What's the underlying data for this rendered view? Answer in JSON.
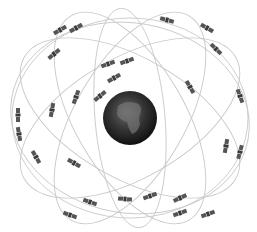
{
  "diagram": {
    "title": "",
    "earth": {
      "cx": 130,
      "cy": 118,
      "r": 27,
      "label": "earth",
      "color": "#2a2a2a"
    },
    "orbit_color": "#c8c8c8",
    "satellite_color": "#555555",
    "orbits": [
      {
        "cx": 130,
        "cy": 118,
        "rx": 118,
        "ry": 100,
        "rot": 0
      },
      {
        "cx": 130,
        "cy": 118,
        "rx": 122,
        "ry": 60,
        "rot": 30
      },
      {
        "cx": 130,
        "cy": 118,
        "rx": 122,
        "ry": 60,
        "rot": -30
      },
      {
        "cx": 130,
        "cy": 118,
        "rx": 118,
        "ry": 55,
        "rot": 60
      },
      {
        "cx": 130,
        "cy": 118,
        "rx": 118,
        "ry": 55,
        "rot": -60
      },
      {
        "cx": 130,
        "cy": 118,
        "rx": 110,
        "ry": 35,
        "rot": 85
      },
      {
        "cx": 130,
        "cy": 118,
        "rx": 120,
        "ry": 95,
        "rot": 10
      }
    ],
    "satellites": [
      {
        "x": 60,
        "y": 30,
        "rot": -30
      },
      {
        "x": 76,
        "y": 28,
        "rot": -30
      },
      {
        "x": 54,
        "y": 54,
        "rot": -40
      },
      {
        "x": 108,
        "y": 64,
        "rot": -20
      },
      {
        "x": 127,
        "y": 61,
        "rot": -20
      },
      {
        "x": 114,
        "y": 78,
        "rot": -30
      },
      {
        "x": 100,
        "y": 96,
        "rot": -40
      },
      {
        "x": 76,
        "y": 97,
        "rot": -70
      },
      {
        "x": 52,
        "y": 110,
        "rot": -80
      },
      {
        "x": 18,
        "y": 115,
        "rot": 90
      },
      {
        "x": 19,
        "y": 134,
        "rot": 80
      },
      {
        "x": 36,
        "y": 157,
        "rot": 60
      },
      {
        "x": 74,
        "y": 163,
        "rot": 30
      },
      {
        "x": 167,
        "y": 20,
        "rot": 15
      },
      {
        "x": 207,
        "y": 28,
        "rot": 30
      },
      {
        "x": 216,
        "y": 49,
        "rot": 45
      },
      {
        "x": 190,
        "y": 87,
        "rot": 60
      },
      {
        "x": 240,
        "y": 96,
        "rot": 70
      },
      {
        "x": 226,
        "y": 146,
        "rot": -80
      },
      {
        "x": 240,
        "y": 152,
        "rot": -75
      },
      {
        "x": 150,
        "y": 196,
        "rot": -20
      },
      {
        "x": 180,
        "y": 198,
        "rot": -25
      },
      {
        "x": 180,
        "y": 213,
        "rot": -20
      },
      {
        "x": 208,
        "y": 214,
        "rot": -20
      },
      {
        "x": 125,
        "y": 199,
        "rot": 5
      },
      {
        "x": 90,
        "y": 202,
        "rot": 20
      },
      {
        "x": 70,
        "y": 215,
        "rot": 20
      }
    ]
  }
}
